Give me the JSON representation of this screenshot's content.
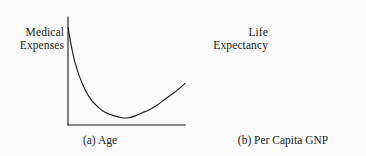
{
  "figure": {
    "background_color": "#fbfbfb",
    "ink_color": "#1a1a1a",
    "panel_count": 2
  },
  "chart_data": [
    {
      "id": "panel-a",
      "type": "line",
      "title": "",
      "caption": "(a) Age",
      "caption_marker": "(a)",
      "xlabel": "Age",
      "ylabel": "Medical Expenses",
      "ylabel_lines": [
        "Medical",
        "Expenses"
      ],
      "xlabel_lines": [
        "(a) Age"
      ],
      "grid": false,
      "legend": false,
      "axis_ticks": false,
      "shape": "u-shaped convex curve: steep decline then gradual rise",
      "xlim": [
        0,
        1
      ],
      "ylim": [
        0,
        1
      ],
      "x": [
        0.0,
        0.03,
        0.06,
        0.1,
        0.15,
        0.2,
        0.26,
        0.32,
        0.39,
        0.46,
        0.52,
        0.58,
        0.64,
        0.7,
        0.76,
        0.82,
        0.88,
        0.94,
        1.0
      ],
      "y": [
        0.94,
        0.75,
        0.6,
        0.46,
        0.33,
        0.24,
        0.17,
        0.12,
        0.09,
        0.07,
        0.07,
        0.09,
        0.12,
        0.15,
        0.19,
        0.24,
        0.29,
        0.34,
        0.4
      ],
      "axis_pixels": {
        "y_axis_x": 68,
        "y_axis_top": 17,
        "x_axis_y": 125,
        "x_axis_right": 185
      }
    },
    {
      "id": "panel-b",
      "type": "line",
      "title": "",
      "caption": "(b) Per Capita GNP",
      "caption_marker": "(b)",
      "xlabel": "Per Capita GNP",
      "ylabel": "Life Expectancy",
      "ylabel_lines": [
        "Life",
        "Expectancy"
      ],
      "xlabel_lines": [
        "(b) Per Capita GNP"
      ],
      "grid": false,
      "legend": false,
      "axis_ticks": false,
      "shape": "concave increasing curve rising steeply then plateauing",
      "xlim": [
        0,
        1
      ],
      "ylim": [
        0,
        1
      ],
      "x": [
        0.0,
        0.02,
        0.05,
        0.09,
        0.14,
        0.2,
        0.27,
        0.34,
        0.42,
        0.5,
        0.58,
        0.66,
        0.74,
        0.82,
        0.9,
        1.0
      ],
      "y": [
        0.1,
        0.23,
        0.36,
        0.47,
        0.57,
        0.66,
        0.73,
        0.79,
        0.84,
        0.88,
        0.91,
        0.93,
        0.945,
        0.955,
        0.96,
        0.96
      ],
      "axis_pixels": {
        "y_axis_x": 33,
        "y_axis_top": 17,
        "x_axis_y": 125,
        "x_axis_right": 145
      }
    }
  ]
}
